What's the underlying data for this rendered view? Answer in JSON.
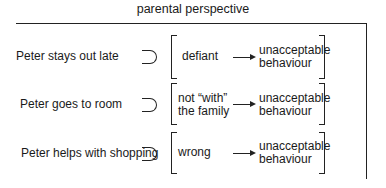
{
  "title": "parental perspective",
  "rows": [
    {
      "event": "Peter stays out late",
      "relation": "subset",
      "interpretation": "defiant",
      "interpretation_line2": "",
      "result_line1": "unacceptable",
      "result_line2": "behaviour"
    },
    {
      "event": "Peter goes to room",
      "relation": "subset",
      "interpretation": "not “with”",
      "interpretation_line2": "the family",
      "result_line1": "unacceptable",
      "result_line2": "behaviour"
    },
    {
      "event": "Peter helps with shopping",
      "relation": "subset",
      "interpretation": "wrong",
      "interpretation_line2": "",
      "result_line1": "unacceptable",
      "result_line2": "behaviour"
    }
  ],
  "icons": {
    "relation": "subset-symbol",
    "arrow": "right-arrow"
  }
}
